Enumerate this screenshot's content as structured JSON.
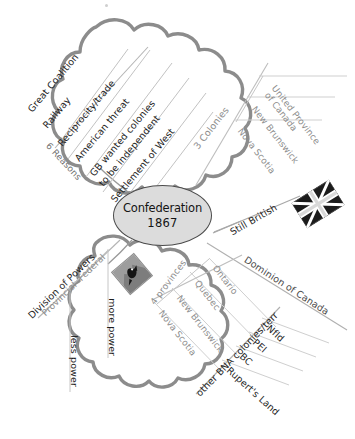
{
  "diagram": {
    "type": "mind-map",
    "center": {
      "line1": "Confederation",
      "line2": "1867"
    },
    "colors": {
      "cloud_outline": "#8c8c8c",
      "center_fill": "#dcdcdc",
      "center_border": "#4b4b4b",
      "branch_dark": "#1e1e1e",
      "branch_mid": "#4a4a4a",
      "branch_light": "#8d8d8d",
      "background": "#ffffff"
    },
    "branches": [
      {
        "id": "reasons",
        "label": "6 Reasons",
        "shape": "cloud",
        "items": [
          "Great Coalition",
          "Railway",
          "Reciprocity/trade",
          "American threat",
          "GB wanted colonies to be independent",
          "Settlement of West"
        ]
      },
      {
        "id": "three-colonies",
        "label": "3 Colonies",
        "shape": "line",
        "items": [
          "United Province of Canada",
          "New Brunswick",
          "Nova Scotia"
        ]
      },
      {
        "id": "still-british",
        "label": "Still British",
        "shape": "line",
        "icon": "union-jack-flag",
        "items": []
      },
      {
        "id": "dominion",
        "label": "Dominion of Canada",
        "shape": "line",
        "items": []
      },
      {
        "id": "four-provinces",
        "label": "4 provinces",
        "shape": "line",
        "items": [
          "Ontario",
          "Quebec",
          "New Brunswick",
          "Nova Scotia"
        ]
      },
      {
        "id": "other-bna",
        "label": "other BNA colonies/terr",
        "shape": "line",
        "items": [
          "Nfld",
          "PEI",
          "BC",
          "Rupert's Land"
        ]
      },
      {
        "id": "division-of-powers",
        "label": "Division of Powers",
        "shape": "cloud",
        "icon": "photo-thumbnail",
        "items": [
          "Federal",
          "more power",
          "Provincial",
          "less power"
        ]
      }
    ],
    "reasons_text": {
      "r1": "Great Coalition",
      "r2": "Railway",
      "r3": "Reciprocity/trade",
      "r4": "American threat",
      "r5a": "GB wanted colonies",
      "r5b": "to be independent",
      "r6": "Settlement of West"
    },
    "colonies_text": {
      "c1a": "United Province",
      "c1b": "of Canada",
      "c2": "New Brunswick",
      "c3": "Nova Scotia"
    },
    "provinces_text": {
      "p1": "Ontario",
      "p2": "Quebec",
      "p3": "New Brunswick",
      "p4": "Nova Scotia"
    },
    "bna_text": {
      "b1": "Nfld",
      "b2": "PEI",
      "b3": "BC",
      "b4": "Rupert's Land"
    },
    "powers_text": {
      "federal": "Federal",
      "more_power": "more power",
      "provincial": "Provincial",
      "less_power": "less power"
    },
    "labels": {
      "reasons": "6 Reasons",
      "three_colonies": "3 Colonies",
      "still_british": "Still British",
      "dominion": "Dominion of Canada",
      "four_provinces": "4 provinces",
      "other_bna": "other BNA colonies/terr",
      "division_of_powers": "Division of Powers"
    }
  }
}
